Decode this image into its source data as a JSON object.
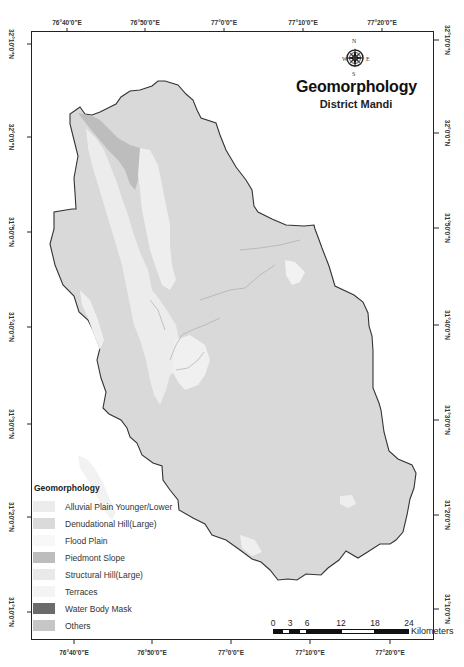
{
  "map": {
    "title": "Geomorphology",
    "subtitle": "District Mandi",
    "longitude_labels": [
      "76°40'0\"E",
      "76°50'0\"E",
      "77°0'0\"E",
      "77°10'0\"E",
      "77°20'0\"E"
    ],
    "latitude_labels": [
      "32°10'0\"N",
      "32°0'0\"N",
      "31°50'0\"N",
      "31°40'0\"N",
      "31°30'0\"N",
      "31°20'0\"N",
      "31°10'0\"N"
    ],
    "compass": {
      "icon": "north-arrow-compass-rose",
      "n": "N",
      "s": "S",
      "e": "E",
      "w": "W"
    }
  },
  "legend": {
    "title": "Geomorphology",
    "items": [
      {
        "label": "Alluvial Plain Younger/Lower",
        "color": "#ececec"
      },
      {
        "label": "Denudational Hill(Large)",
        "color": "#dadada"
      },
      {
        "label": "Flood Plain",
        "color": "#f8f8f8"
      },
      {
        "label": "Piedmont Slope",
        "color": "#bdbdbd"
      },
      {
        "label": "Structural Hill(Large)",
        "color": "#e9e9e9"
      },
      {
        "label": "Terraces",
        "color": "#f4f4f4"
      },
      {
        "label": "Water Body Mask",
        "color": "#6b6b6b"
      },
      {
        "label": "Others",
        "color": "#c6c6c6"
      }
    ]
  },
  "scalebar": {
    "labels": [
      "0",
      "3",
      "6",
      "12",
      "18",
      "24"
    ],
    "unit": "Kilometers"
  },
  "colors": {
    "district_fill": "#d9d9d9",
    "alluvial_fill": "#ececec",
    "piedmont_fill": "#bdbdbd",
    "boundary": "#333333"
  }
}
